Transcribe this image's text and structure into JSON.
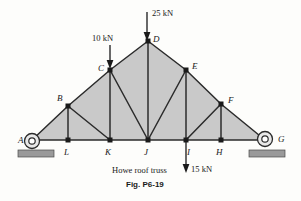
{
  "figure": {
    "caption": "Howe roof truss",
    "number": "Fig. P6-19",
    "background_color": "#fdfdfb",
    "member_color": "#2b2b2b",
    "panel_fill": "#c9c9c9",
    "support_fill": "#9a9a9a"
  },
  "joints": [
    {
      "id": "A",
      "label": "A",
      "x": 32,
      "y": 140,
      "label_x": 18,
      "label_y": 143,
      "support": "pin"
    },
    {
      "id": "B",
      "label": "B",
      "x": 68,
      "y": 106,
      "label_x": 60,
      "label_y": 101
    },
    {
      "id": "C",
      "label": "C",
      "x": 110,
      "y": 70,
      "label_x": 100,
      "label_y": 70
    },
    {
      "id": "D",
      "label": "D",
      "x": 148,
      "y": 41,
      "label_x": 155,
      "label_y": 41
    },
    {
      "id": "E",
      "label": "E",
      "x": 186,
      "y": 70,
      "label_x": 193,
      "label_y": 69
    },
    {
      "id": "F",
      "label": "F",
      "x": 221,
      "y": 104,
      "label_x": 229,
      "label_y": 103
    },
    {
      "id": "G",
      "label": "G",
      "x": 265,
      "y": 140,
      "label_x": 280,
      "label_y": 142,
      "support": "roller"
    },
    {
      "id": "L",
      "label": "L",
      "x": 68,
      "y": 140,
      "label_x": 65,
      "label_y": 154
    },
    {
      "id": "K",
      "label": "K",
      "x": 110,
      "y": 140,
      "label_x": 107,
      "label_y": 154
    },
    {
      "id": "J",
      "label": "J",
      "x": 148,
      "y": 140,
      "label_x": 145,
      "label_y": 154
    },
    {
      "id": "I",
      "label": "I",
      "x": 186,
      "y": 140,
      "label_x": 188,
      "label_y": 154
    },
    {
      "id": "H",
      "label": "H",
      "x": 221,
      "y": 140,
      "label_x": 217,
      "label_y": 154
    }
  ],
  "members": [
    {
      "from": "A",
      "to": "B",
      "type": "top-chord"
    },
    {
      "from": "B",
      "to": "C",
      "type": "top-chord"
    },
    {
      "from": "C",
      "to": "D",
      "type": "top-chord"
    },
    {
      "from": "D",
      "to": "E",
      "type": "top-chord"
    },
    {
      "from": "E",
      "to": "F",
      "type": "top-chord"
    },
    {
      "from": "F",
      "to": "G",
      "type": "top-chord"
    },
    {
      "from": "A",
      "to": "L",
      "type": "bottom-chord"
    },
    {
      "from": "L",
      "to": "K",
      "type": "bottom-chord"
    },
    {
      "from": "K",
      "to": "J",
      "type": "bottom-chord"
    },
    {
      "from": "J",
      "to": "I",
      "type": "bottom-chord"
    },
    {
      "from": "I",
      "to": "H",
      "type": "bottom-chord"
    },
    {
      "from": "H",
      "to": "G",
      "type": "bottom-chord"
    },
    {
      "from": "B",
      "to": "L",
      "type": "vertical"
    },
    {
      "from": "C",
      "to": "K",
      "type": "vertical"
    },
    {
      "from": "D",
      "to": "J",
      "type": "vertical"
    },
    {
      "from": "E",
      "to": "I",
      "type": "vertical"
    },
    {
      "from": "F",
      "to": "H",
      "type": "vertical"
    },
    {
      "from": "B",
      "to": "K",
      "type": "diagonal"
    },
    {
      "from": "C",
      "to": "J",
      "type": "diagonal"
    },
    {
      "from": "E",
      "to": "J",
      "type": "diagonal"
    },
    {
      "from": "F",
      "to": "I",
      "type": "diagonal"
    }
  ],
  "panels": [
    {
      "name": "panel-left-outer",
      "points": "32,140 68,106 68,140"
    },
    {
      "name": "panel-left-mid",
      "points": "68,106 110,70 110,140 68,140"
    },
    {
      "name": "panel-left-apex",
      "points": "110,70 148,41 148,140 110,140"
    },
    {
      "name": "panel-right-apex",
      "points": "148,41 186,70 186,140 148,140"
    },
    {
      "name": "panel-right-mid",
      "points": "186,70 221,104 221,140 186,140"
    },
    {
      "name": "panel-right-outer",
      "points": "221,104 265,140 221,140"
    }
  ],
  "loads": [
    {
      "id": "load-25kN",
      "label": "25 kN",
      "magnitude": 25,
      "unit": "kN",
      "at_joint": "D",
      "direction": "down",
      "arrow_x": 147,
      "arrow_y1": 12,
      "arrow_y2": 39,
      "label_x": 153,
      "label_y": 15
    },
    {
      "id": "load-10kN",
      "label": "10 kN",
      "magnitude": 10,
      "unit": "kN",
      "at_joint": "C",
      "direction": "down",
      "arrow_x": 110,
      "arrow_y1": 45,
      "arrow_y2": 68,
      "label_x": 93,
      "label_y": 41
    },
    {
      "id": "load-15kN",
      "label": "15 kN",
      "magnitude": 15,
      "unit": "kN",
      "at_joint": "I",
      "direction": "down",
      "arrow_x": 186,
      "arrow_y1": 141,
      "arrow_y2": 173,
      "label_x": 192,
      "label_y": 171
    }
  ],
  "supports": {
    "left": {
      "joint": "A",
      "type": "pin",
      "circle_x": 32,
      "circle_y": 141,
      "base_x": 18,
      "base_y": 150,
      "base_w": 36,
      "base_h": 7
    },
    "right": {
      "joint": "G",
      "type": "roller",
      "circle_x": 265,
      "circle_y": 139,
      "base_x": 249,
      "base_y": 150,
      "base_w": 36,
      "base_h": 7
    }
  },
  "caption_pos": {
    "caption_x": 113,
    "caption_y": 172,
    "fignum_x": 125,
    "fignum_y": 186
  }
}
